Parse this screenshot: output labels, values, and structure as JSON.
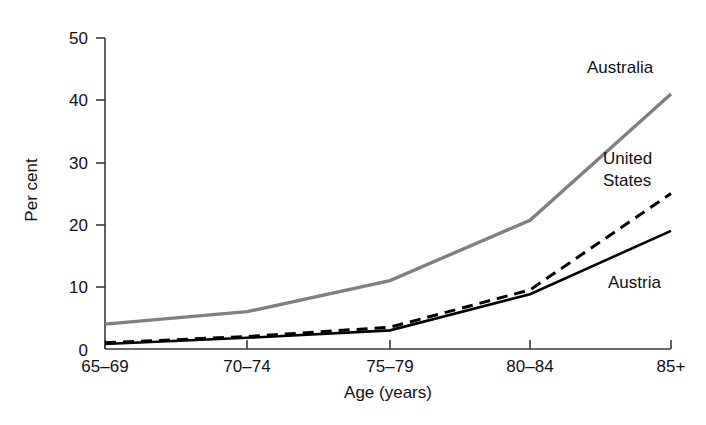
{
  "chart_data": {
    "type": "line",
    "title": "",
    "xlabel": "Age (years)",
    "ylabel": "Per cent",
    "categories": [
      "65–69",
      "70–74",
      "75–79",
      "80–84",
      "85+"
    ],
    "ylim": [
      0,
      50
    ],
    "yticks": [
      0,
      10,
      20,
      30,
      40,
      50
    ],
    "ytick_labels": [
      "0",
      "10",
      "20",
      "30",
      "40",
      "50"
    ],
    "grid": false,
    "legend_position": "inline-right-annotations",
    "series": [
      {
        "name": "Australia",
        "values": [
          4,
          6,
          11,
          20.7,
          41
        ],
        "color": "#808080",
        "style": "solid",
        "width": 3.4
      },
      {
        "name": "United States",
        "values": [
          1,
          2,
          3.5,
          9.5,
          25
        ],
        "color": "#000000",
        "style": "dashed",
        "width": 3.0
      },
      {
        "name": "Austria",
        "values": [
          0.8,
          1.8,
          3,
          8.8,
          19
        ],
        "color": "#000000",
        "style": "solid",
        "width": 2.6
      }
    ],
    "annotations": [
      {
        "text": "Australia",
        "series": "Australia"
      },
      {
        "text": "United",
        "series": "United States"
      },
      {
        "text": "States",
        "series": "United States"
      },
      {
        "text": "Austria",
        "series": "Austria"
      }
    ]
  },
  "axis": {
    "y_title": "Per cent",
    "x_title": "Age (years)"
  },
  "labels": {
    "australia": "Australia",
    "united": "United",
    "states": "States",
    "austria": "Austria"
  },
  "yticks": {
    "t0": "0",
    "t1": "10",
    "t2": "20",
    "t3": "30",
    "t4": "40",
    "t5": "50"
  },
  "xticks": {
    "t0": "65–69",
    "t1": "70–74",
    "t2": "75–79",
    "t3": "80–84",
    "t4": "85+"
  }
}
